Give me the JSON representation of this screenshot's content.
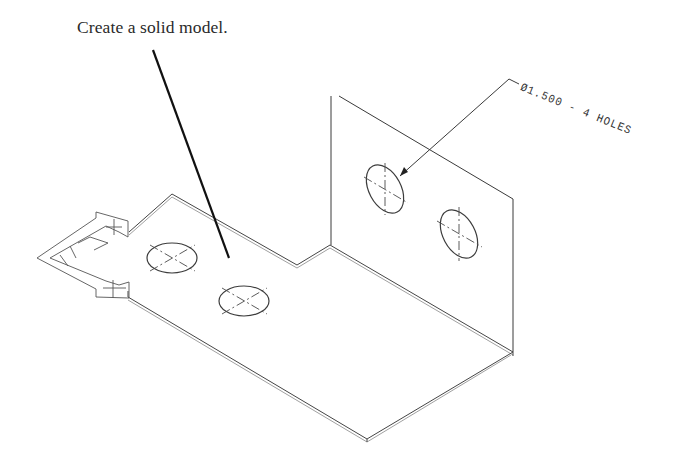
{
  "figure": {
    "instruction": "Create a solid model.",
    "callout": {
      "label": "Ø1.500 - 4 HOLES",
      "diameter": "1.500",
      "count": "4",
      "feature": "HOLES"
    },
    "part": {
      "description": "Isometric view of L-shaped sheet metal bracket with notched base plate and vertical flange",
      "base_plate_holes": 2,
      "vertical_flange_holes": 2
    },
    "icons": {
      "ucs": "ucs-axis-icon"
    },
    "colors": {
      "background": "#ffffff",
      "line": "#444444",
      "text": "#2a2a2a"
    }
  }
}
